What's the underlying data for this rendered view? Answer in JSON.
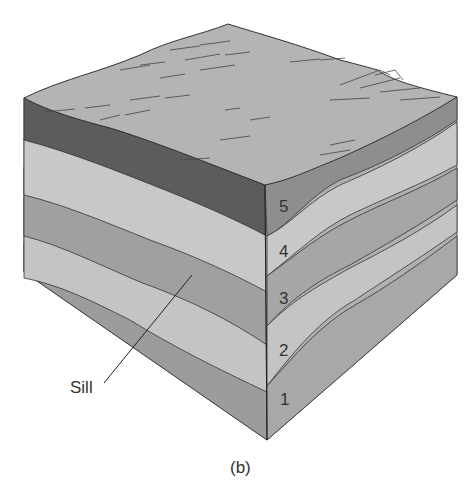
{
  "figure": {
    "caption": "(b)",
    "callout": "Sill",
    "layers": [
      {
        "id": 5,
        "label": "5",
        "color": "#8e8e8e",
        "left_color": "#5f5f5f"
      },
      {
        "id": 4,
        "label": "4",
        "color": "#c8c8c8"
      },
      {
        "id": 3,
        "label": "3",
        "color": "#a2a2a2"
      },
      {
        "id": 2,
        "label": "2",
        "color": "#c4c4c4"
      },
      {
        "id": 1,
        "label": "1",
        "color": "#a0a0a0"
      }
    ],
    "surface_color": "#b4b4b4"
  }
}
